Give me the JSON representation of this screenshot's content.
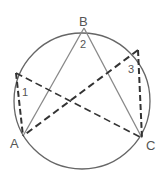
{
  "diagram": {
    "points": {
      "A": {
        "label": "A"
      },
      "B": {
        "label": "B"
      },
      "C": {
        "label": "C"
      }
    },
    "angles": [
      {
        "label": "1"
      },
      {
        "label": "2"
      },
      {
        "label": "3"
      }
    ],
    "colors": {
      "circle": "#666666",
      "solid": "#888888",
      "dashed": "#333333",
      "text": "#555555"
    }
  }
}
